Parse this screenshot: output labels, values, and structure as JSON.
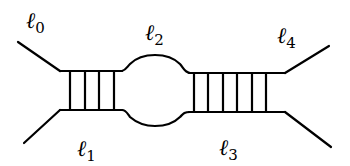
{
  "diagram": {
    "labels": [
      {
        "id": "l0",
        "symbol": "ℓ",
        "subscript": "0",
        "x": 26,
        "y": 28
      },
      {
        "id": "l1",
        "symbol": "ℓ",
        "subscript": "1",
        "x": 77,
        "y": 156
      },
      {
        "id": "l2",
        "symbol": "ℓ",
        "subscript": "2",
        "x": 145,
        "y": 40
      },
      {
        "id": "l3",
        "symbol": "ℓ",
        "subscript": "3",
        "x": 219,
        "y": 155
      },
      {
        "id": "l4",
        "symbol": "ℓ",
        "subscript": "4",
        "x": 277,
        "y": 43
      }
    ],
    "external_legs": [
      {
        "id": "leg-top-left",
        "from": [
          18,
          42
        ],
        "to": [
          60,
          71
        ]
      },
      {
        "id": "leg-bottom-left",
        "from": [
          24,
          143
        ],
        "to": [
          60,
          110
        ]
      },
      {
        "id": "leg-top-right",
        "from": [
          285,
          73
        ],
        "to": [
          329,
          46
        ]
      },
      {
        "id": "leg-bottom-right",
        "from": [
          285,
          112
        ],
        "to": [
          331,
          147
        ]
      }
    ],
    "left_ladder": {
      "rail_top_y": 71,
      "rail_bottom_y": 110,
      "x_start": 60,
      "x_end": 122,
      "rungs_x": [
        70,
        85,
        99,
        114
      ]
    },
    "bubble": {
      "x_start": 122,
      "x_end": 187,
      "top_y": 57,
      "bottom_y": 125
    },
    "right_ladder": {
      "rail_top_y": 73,
      "rail_bottom_y": 112,
      "x_start": 187,
      "x_end": 285,
      "rungs_x": [
        194,
        208,
        223,
        237,
        252,
        266
      ]
    },
    "colors": {
      "stroke": "#000000",
      "background": "#ffffff"
    }
  }
}
